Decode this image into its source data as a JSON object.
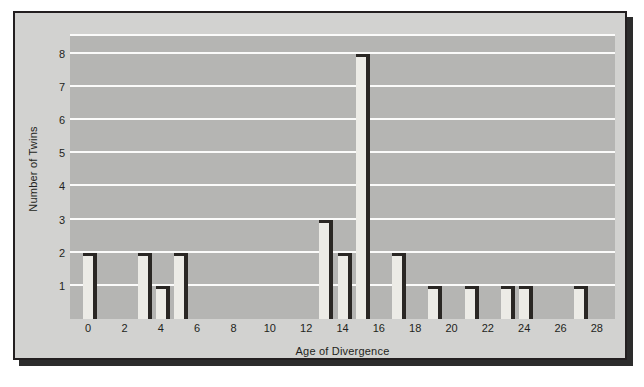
{
  "chart_data": {
    "type": "bar",
    "title": "",
    "xlabel": "Age of Divergence",
    "ylabel": "Number of Twins",
    "x": [
      0,
      3,
      4,
      5,
      13,
      14,
      15,
      17,
      19,
      21,
      23,
      24,
      27
    ],
    "values": [
      2,
      2,
      1,
      2,
      3,
      2,
      8,
      2,
      1,
      1,
      1,
      1,
      1
    ],
    "xlim": [
      -1,
      29
    ],
    "ylim": [
      0,
      8.6
    ],
    "xticks": [
      0,
      2,
      4,
      6,
      8,
      10,
      12,
      14,
      16,
      18,
      20,
      22,
      24,
      26,
      28
    ],
    "yticks": [
      1,
      2,
      3,
      4,
      5,
      6,
      7,
      8
    ],
    "grid": "horizontal",
    "legend": "none",
    "colors": {
      "plot_background": "#b5b5b3",
      "figure_background": "#d2d2d0",
      "gridline": "#fbfbfa",
      "bar_face": "#ecebe6",
      "bar_edge": "#2a2724",
      "text": "#231f20",
      "frame_border": "#231f20"
    }
  }
}
